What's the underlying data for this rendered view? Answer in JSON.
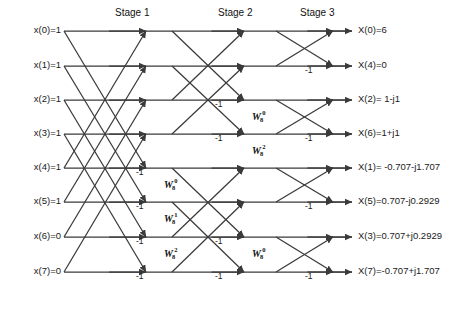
{
  "figure": {
    "kind": "fft-butterfly-diagram",
    "title": "",
    "size": {
      "width": 468,
      "height": 314
    },
    "line_color": "#3a3a3a",
    "text_color": "#1a1a1a",
    "background": "#ffffff"
  },
  "stages": [
    {
      "id": "stage1",
      "label": "Stage 1",
      "label_x": 115,
      "label_y": 14,
      "x_left": 64,
      "x_right": 146,
      "pair_span": 4
    },
    {
      "id": "stage2",
      "label": "Stage 2",
      "label_x": 218,
      "label_y": 14,
      "x_left": 172,
      "x_right": 244,
      "pair_span": 2
    },
    {
      "id": "stage3",
      "label": "Stage 3",
      "label_x": 300,
      "label_y": 14,
      "x_left": 276,
      "x_right": 333,
      "pair_span": 1
    }
  ],
  "rows": {
    "y": [
      31,
      66,
      100,
      134,
      168,
      202,
      237,
      272
    ],
    "x_start": 64,
    "x_end": 352
  },
  "inputs": [
    {
      "name": "x(0)",
      "value": "1",
      "label": "x(0)=1",
      "row": 0
    },
    {
      "name": "x(1)",
      "value": "1",
      "label": "x(1)=1",
      "row": 1
    },
    {
      "name": "x(2)",
      "value": "1",
      "label": "x(2)=1",
      "row": 2
    },
    {
      "name": "x(3)",
      "value": "1",
      "label": "x(3)=1",
      "row": 3
    },
    {
      "name": "x(4)",
      "value": "1",
      "label": "x(4)=1",
      "row": 4
    },
    {
      "name": "x(5)",
      "value": "1",
      "label": "x(5)=1",
      "row": 5
    },
    {
      "name": "x(6)",
      "value": "0",
      "label": "x(6)=0",
      "row": 6
    },
    {
      "name": "x(7)",
      "value": "0",
      "label": "x(7)=0",
      "row": 7
    }
  ],
  "outputs": [
    {
      "name": "X(0)",
      "value": "6",
      "label": "X(0)=6",
      "row": 0
    },
    {
      "name": "X(4)",
      "value": "0",
      "label": "X(4)=0",
      "row": 1
    },
    {
      "name": "X(2)",
      "value": "1-j1",
      "label": "X(2)= 1-j1",
      "row": 2
    },
    {
      "name": "X(6)",
      "value": "1+j1",
      "label": "X(6)=1+j1",
      "row": 3
    },
    {
      "name": "X(1)",
      "value": "-0.707-j1.707",
      "label": "X(1)= -0.707-j1.707",
      "row": 4
    },
    {
      "name": "X(5)",
      "value": "0.707-j0.2929",
      "label": "X(5)=0.707-j0.2929",
      "row": 5
    },
    {
      "name": "X(3)",
      "value": "0.707+j0.2929",
      "label": "X(3)=0.707+j0.2929",
      "row": 6
    },
    {
      "name": "X(7)",
      "value": "-0.707+j1.707",
      "label": "X(7)=-0.707+j1.707",
      "row": 7
    }
  ],
  "twiddle_labels": [
    {
      "id": "s1-w0",
      "base": "W",
      "sub": "8",
      "sup": "0",
      "x": 164,
      "y": 186,
      "stage": "stage1"
    },
    {
      "id": "s1-w1",
      "base": "W",
      "sub": "8",
      "sup": "1",
      "x": 164,
      "y": 220,
      "stage": "stage1"
    },
    {
      "id": "s1-w2",
      "base": "W",
      "sub": "8",
      "sup": "2",
      "x": 164,
      "y": 255,
      "stage": "stage1"
    },
    {
      "id": "s2-w0-top",
      "base": "W",
      "sub": "8",
      "sup": "0",
      "x": 252,
      "y": 118,
      "stage": "stage2"
    },
    {
      "id": "s2-w2-top",
      "base": "W",
      "sub": "8",
      "sup": "2",
      "x": 252,
      "y": 152,
      "stage": "stage2"
    },
    {
      "id": "s2-w0-bot",
      "base": "W",
      "sub": "8",
      "sup": "0",
      "x": 252,
      "y": 255,
      "stage": "stage2"
    }
  ],
  "minus_one_labels": [
    {
      "id": "s1-m4",
      "text": "-1",
      "x": 136,
      "y": 174
    },
    {
      "id": "s1-m5",
      "text": "-1",
      "x": 136,
      "y": 208
    },
    {
      "id": "s1-m6",
      "text": "-1",
      "x": 136,
      "y": 243
    },
    {
      "id": "s1-m7",
      "text": "-1",
      "x": 136,
      "y": 278
    },
    {
      "id": "s2-m2",
      "text": "-1",
      "x": 215,
      "y": 106
    },
    {
      "id": "s2-m3",
      "text": "-1",
      "x": 215,
      "y": 140
    },
    {
      "id": "s2-m6",
      "text": "-1",
      "x": 215,
      "y": 243
    },
    {
      "id": "s2-m7",
      "text": "-1",
      "x": 215,
      "y": 278
    },
    {
      "id": "s3-m1",
      "text": "-1",
      "x": 305,
      "y": 72
    },
    {
      "id": "s3-m3",
      "text": "-1",
      "x": 305,
      "y": 140
    },
    {
      "id": "s3-m5",
      "text": "-1",
      "x": 305,
      "y": 208
    },
    {
      "id": "s3-m7",
      "text": "-1",
      "x": 305,
      "y": 278
    }
  ],
  "chart_data": {
    "type": "diagram",
    "input_sequence": [
      1,
      1,
      1,
      1,
      1,
      1,
      0,
      0
    ],
    "output_order": [
      "X(0)",
      "X(4)",
      "X(2)",
      "X(6)",
      "X(1)",
      "X(5)",
      "X(3)",
      "X(7)"
    ],
    "output_values": [
      "6",
      "0",
      "1-j1",
      "1+j1",
      "-0.707-j1.707",
      "0.707-j0.2929",
      "0.707+j0.2929",
      "-0.707+j1.707"
    ],
    "stage_labels": [
      "Stage 1",
      "Stage 2",
      "Stage 3"
    ],
    "twiddle_factors": [
      "W80",
      "W81",
      "W82"
    ],
    "butterfly_sign": "-1"
  }
}
